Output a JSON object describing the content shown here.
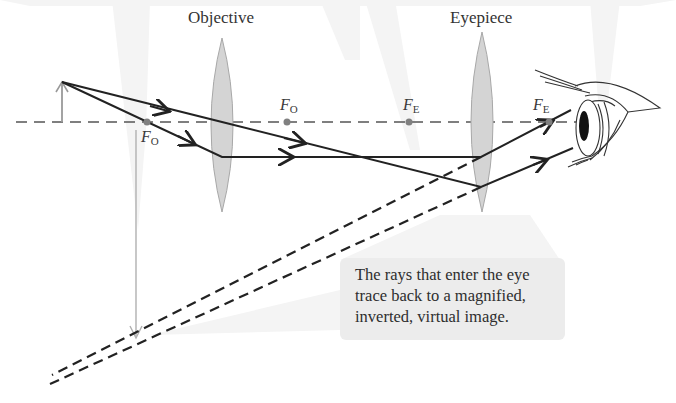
{
  "diagram": {
    "type": "compound-microscope-ray-diagram",
    "labels": {
      "objective": "Objective",
      "eyepiece": "Eyepiece"
    },
    "focal_points": [
      {
        "id": "fo-left",
        "symbol": "F",
        "subscript": "O",
        "x": 147,
        "y": 122,
        "label_x": 141,
        "label_y": 128
      },
      {
        "id": "fo-right",
        "symbol": "F",
        "subscript": "O",
        "x": 287,
        "y": 122,
        "label_x": 280,
        "label_y": 95
      },
      {
        "id": "fe-left",
        "symbol": "F",
        "subscript": "E",
        "x": 409,
        "y": 122,
        "label_x": 403,
        "label_y": 95
      },
      {
        "id": "fe-right",
        "symbol": "F",
        "subscript": "E",
        "x": 549,
        "y": 122,
        "label_x": 533,
        "label_y": 95
      }
    ],
    "callout": {
      "lines": [
        "The rays that enter the eye",
        "trace back to a magnified,",
        "inverted, virtual image."
      ]
    },
    "colors": {
      "ray": "#222222",
      "axis": "#555555",
      "lens_fill": "#d4d4d4",
      "lens_stroke": "#aaaaaa",
      "focal_dot": "#808080",
      "image_arrow": "#aaaaaa",
      "callout_bg": "#ececec",
      "background_beam": "#f3f3f3"
    },
    "geometry": {
      "axis_y": 122,
      "object": {
        "x": 62,
        "top_y": 82
      },
      "objective": {
        "cx": 222,
        "top": 38,
        "bottom": 212,
        "half_width": 11
      },
      "eyepiece": {
        "cx": 482,
        "top": 32,
        "bottom": 212,
        "half_width": 11
      },
      "image": {
        "x": 136,
        "top_y": 128,
        "tip_y": 338
      }
    }
  }
}
